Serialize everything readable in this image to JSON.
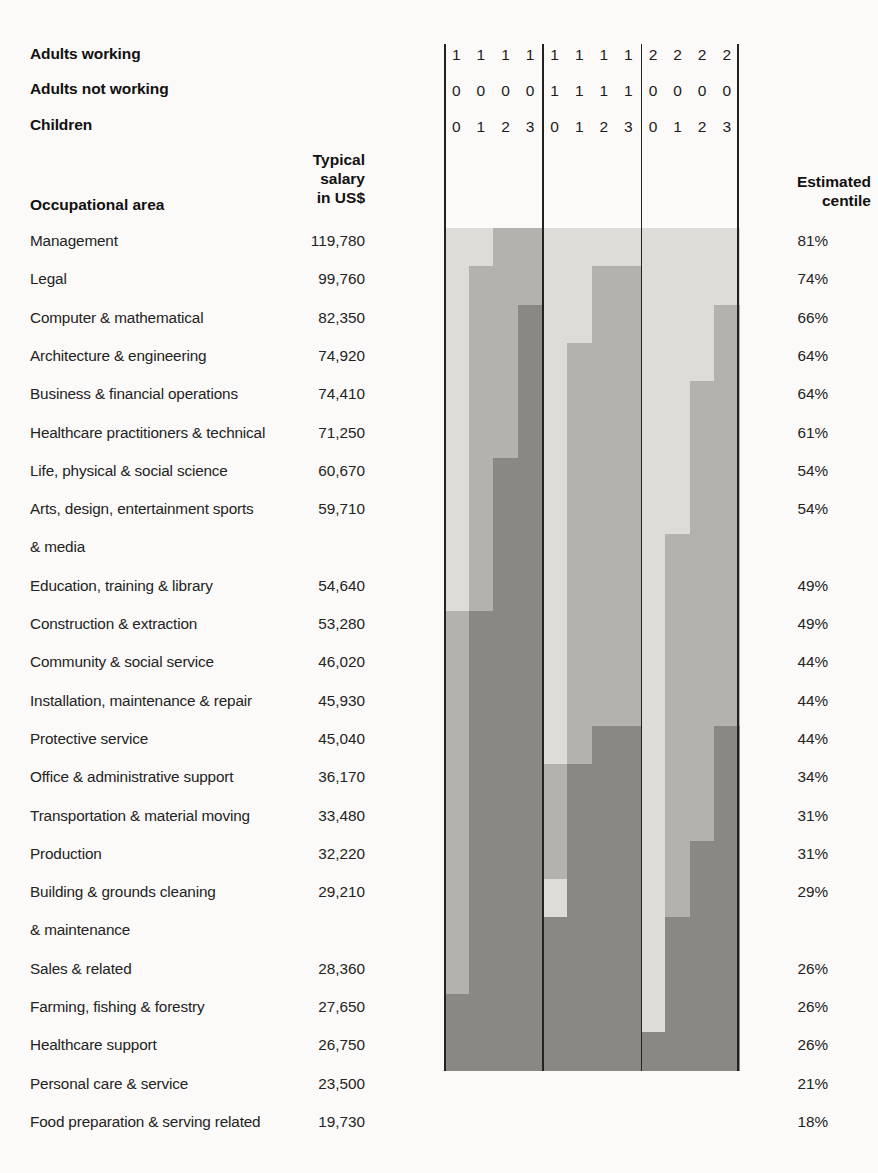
{
  "header": {
    "stack_labels": [
      {
        "name": "adults-working",
        "text": "Adults working"
      },
      {
        "name": "adults-not-working",
        "text": "Adults not working"
      },
      {
        "name": "children",
        "text": "Children"
      }
    ],
    "occupation_column_title": "Occupational area",
    "salary_column_title": "Typical\nsalary\nin US$",
    "centile_column_title": "Estimated\ncentile",
    "digit_rows": [
      [
        "1",
        "1",
        "1",
        "1",
        "1",
        "1",
        "1",
        "1",
        "2",
        "2",
        "2",
        "2"
      ],
      [
        "0",
        "0",
        "0",
        "0",
        "1",
        "1",
        "1",
        "1",
        "0",
        "0",
        "0",
        "0"
      ],
      [
        "0",
        "1",
        "2",
        "3",
        "0",
        "1",
        "2",
        "3",
        "0",
        "1",
        "2",
        "3"
      ]
    ]
  },
  "palette": {
    "light": "#dedcd9",
    "medium": "#b4b2ae",
    "dark": "#8a8884",
    "rule": "#24221f",
    "page_bg": "#fbfaf8"
  },
  "chart_data": {
    "type": "heatmap",
    "xlabel": "",
    "ylabel": "Occupational area",
    "legend": [
      "Adults working",
      "Adults not working",
      "Children"
    ],
    "grid": false,
    "column_groups": [
      {
        "adults_working": "1",
        "adults_not_working": "0",
        "children": [
          "0",
          "1",
          "2",
          "3"
        ]
      },
      {
        "adults_working": "1",
        "adults_not_working": "1",
        "children": [
          "0",
          "1",
          "2",
          "3"
        ]
      },
      {
        "adults_working": "2",
        "adults_not_working": "0",
        "children": [
          "0",
          "1",
          "2",
          "3"
        ]
      }
    ],
    "columns": [
      "1-0-0",
      "1-0-1",
      "1-0-2",
      "1-0-3",
      "1-1-0",
      "1-1-1",
      "1-1-2",
      "1-1-3",
      "2-0-0",
      "2-0-1",
      "2-0-2",
      "2-0-3"
    ],
    "shade_levels": [
      "light",
      "medium",
      "dark"
    ],
    "categories": [
      "Management",
      "Legal",
      "Computer & mathematical",
      "Architecture & engineering",
      "Business & financial operations",
      "Healthcare practitioners & technical",
      "Life, physical & social science",
      "Arts, design, entertainment sports & media",
      "Education, training & library",
      "Construction & extraction",
      "Community & social service",
      "Installation, maintenance & repair",
      "Protective service",
      "Office & administrative support",
      "Transportation & material moving",
      "Production",
      "Building & grounds cleaning & maintenance",
      "Sales & related",
      "Farming, fishing & forestry",
      "Healthcare support",
      "Personal care & service",
      "Food preparation & serving related"
    ],
    "rows": [
      {
        "occupation": "Management",
        "occupation_lines": [
          "Management"
        ],
        "salary": "119,780",
        "salary_value": 119780,
        "centile": "81%",
        "centile_value": 81,
        "cells": [
          "light",
          "light",
          "medium",
          "medium",
          "light",
          "light",
          "light",
          "light",
          "light",
          "light",
          "light",
          "light"
        ]
      },
      {
        "occupation": "Legal",
        "occupation_lines": [
          "Legal"
        ],
        "salary": "99,760",
        "salary_value": 99760,
        "centile": "74%",
        "centile_value": 74,
        "cells": [
          "light",
          "medium",
          "medium",
          "medium",
          "light",
          "light",
          "medium",
          "medium",
          "light",
          "light",
          "light",
          "light"
        ]
      },
      {
        "occupation": "Computer & mathematical",
        "occupation_lines": [
          "Computer & mathematical"
        ],
        "salary": "82,350",
        "salary_value": 82350,
        "centile": "66%",
        "centile_value": 66,
        "cells": [
          "light",
          "medium",
          "medium",
          "dark",
          "light",
          "light",
          "medium",
          "medium",
          "light",
          "light",
          "light",
          "medium"
        ]
      },
      {
        "occupation": "Architecture & engineering",
        "occupation_lines": [
          "Architecture & engineering"
        ],
        "salary": "74,920",
        "salary_value": 74920,
        "centile": "64%",
        "centile_value": 64,
        "cells": [
          "light",
          "medium",
          "medium",
          "dark",
          "light",
          "medium",
          "medium",
          "medium",
          "light",
          "light",
          "light",
          "medium"
        ]
      },
      {
        "occupation": "Business & financial operations",
        "occupation_lines": [
          "Business & financial operations"
        ],
        "salary": "74,410",
        "salary_value": 74410,
        "centile": "64%",
        "centile_value": 64,
        "cells": [
          "light",
          "medium",
          "medium",
          "dark",
          "light",
          "medium",
          "medium",
          "medium",
          "light",
          "light",
          "medium",
          "medium"
        ]
      },
      {
        "occupation": "Healthcare practitioners & technical",
        "occupation_lines": [
          "Healthcare practitioners & technical"
        ],
        "salary": "71,250",
        "salary_value": 71250,
        "centile": "61%",
        "centile_value": 61,
        "cells": [
          "light",
          "medium",
          "medium",
          "dark",
          "light",
          "medium",
          "medium",
          "medium",
          "light",
          "light",
          "medium",
          "medium"
        ]
      },
      {
        "occupation": "Life, physical & social science",
        "occupation_lines": [
          "Life, physical & social science"
        ],
        "salary": "60,670",
        "salary_value": 60670,
        "centile": "54%",
        "centile_value": 54,
        "cells": [
          "light",
          "medium",
          "dark",
          "dark",
          "light",
          "medium",
          "medium",
          "medium",
          "light",
          "light",
          "medium",
          "medium"
        ]
      },
      {
        "occupation": "Arts, design, entertainment sports & media",
        "occupation_lines": [
          "Arts, design, entertainment sports",
          "& media"
        ],
        "salary": "59,710",
        "salary_value": 59710,
        "centile": "54%",
        "centile_value": 54,
        "cells": [
          "light",
          "medium",
          "dark",
          "dark",
          "light",
          "medium",
          "medium",
          "medium",
          "light",
          "light",
          "medium",
          "medium"
        ]
      },
      {
        "occupation": "Education, training & library",
        "occupation_lines": [
          "Education, training & library"
        ],
        "salary": "54,640",
        "salary_value": 54640,
        "centile": "49%",
        "centile_value": 49,
        "cells": [
          "light",
          "medium",
          "dark",
          "dark",
          "light",
          "medium",
          "medium",
          "medium",
          "light",
          "medium",
          "medium",
          "medium"
        ]
      },
      {
        "occupation": "Construction & extraction",
        "occupation_lines": [
          "Construction & extraction"
        ],
        "salary": "53,280",
        "salary_value": 53280,
        "centile": "49%",
        "centile_value": 49,
        "cells": [
          "light",
          "medium",
          "dark",
          "dark",
          "light",
          "medium",
          "medium",
          "medium",
          "light",
          "medium",
          "medium",
          "medium"
        ]
      },
      {
        "occupation": "Community & social service",
        "occupation_lines": [
          "Community & social service"
        ],
        "salary": "46,020",
        "salary_value": 46020,
        "centile": "44%",
        "centile_value": 44,
        "cells": [
          "medium",
          "dark",
          "dark",
          "dark",
          "light",
          "medium",
          "medium",
          "medium",
          "light",
          "medium",
          "medium",
          "medium"
        ]
      },
      {
        "occupation": "Installation, maintenance & repair",
        "occupation_lines": [
          "Installation, maintenance & repair"
        ],
        "salary": "45,930",
        "salary_value": 45930,
        "centile": "44%",
        "centile_value": 44,
        "cells": [
          "medium",
          "dark",
          "dark",
          "dark",
          "light",
          "medium",
          "medium",
          "medium",
          "light",
          "medium",
          "medium",
          "medium"
        ]
      },
      {
        "occupation": "Protective service",
        "occupation_lines": [
          "Protective service"
        ],
        "salary": "45,040",
        "salary_value": 45040,
        "centile": "44%",
        "centile_value": 44,
        "cells": [
          "medium",
          "dark",
          "dark",
          "dark",
          "light",
          "medium",
          "medium",
          "medium",
          "light",
          "medium",
          "medium",
          "medium"
        ]
      },
      {
        "occupation": "Office & administrative support",
        "occupation_lines": [
          "Office & administrative support"
        ],
        "salary": "36,170",
        "salary_value": 36170,
        "centile": "34%",
        "centile_value": 34,
        "cells": [
          "medium",
          "dark",
          "dark",
          "dark",
          "light",
          "medium",
          "dark",
          "dark",
          "light",
          "medium",
          "medium",
          "dark"
        ]
      },
      {
        "occupation": "Transportation & material moving",
        "occupation_lines": [
          "Transportation & material moving"
        ],
        "salary": "33,480",
        "salary_value": 33480,
        "centile": "31%",
        "centile_value": 31,
        "cells": [
          "medium",
          "dark",
          "dark",
          "dark",
          "medium",
          "dark",
          "dark",
          "dark",
          "light",
          "medium",
          "medium",
          "dark"
        ]
      },
      {
        "occupation": "Production",
        "occupation_lines": [
          "Production"
        ],
        "salary": "32,220",
        "salary_value": 32220,
        "centile": "31%",
        "centile_value": 31,
        "cells": [
          "medium",
          "dark",
          "dark",
          "dark",
          "medium",
          "dark",
          "dark",
          "dark",
          "light",
          "medium",
          "medium",
          "dark"
        ]
      },
      {
        "occupation": "Building & grounds cleaning & maintenance",
        "occupation_lines": [
          "Building & grounds cleaning",
          "& maintenance"
        ],
        "salary": "29,210",
        "salary_value": 29210,
        "centile": "29%",
        "centile_value": 29,
        "cells": [
          "medium",
          "dark",
          "dark",
          "dark",
          "medium",
          "dark",
          "dark",
          "dark",
          "light",
          "medium",
          "dark",
          "dark"
        ]
      },
      {
        "occupation": "Sales & related",
        "occupation_lines": [
          "Sales & related"
        ],
        "salary": "28,360",
        "salary_value": 28360,
        "centile": "26%",
        "centile_value": 26,
        "cells": [
          "medium",
          "dark",
          "dark",
          "dark",
          "light",
          "dark",
          "dark",
          "dark",
          "light",
          "medium",
          "dark",
          "dark"
        ]
      },
      {
        "occupation": "Farming, fishing & forestry",
        "occupation_lines": [
          "Farming, fishing & forestry"
        ],
        "salary": "27,650",
        "salary_value": 27650,
        "centile": "26%",
        "centile_value": 26,
        "cells": [
          "medium",
          "dark",
          "dark",
          "dark",
          "dark",
          "dark",
          "dark",
          "dark",
          "light",
          "dark",
          "dark",
          "dark"
        ]
      },
      {
        "occupation": "Healthcare support",
        "occupation_lines": [
          "Healthcare support"
        ],
        "salary": "26,750",
        "salary_value": 26750,
        "centile": "26%",
        "centile_value": 26,
        "cells": [
          "medium",
          "dark",
          "dark",
          "dark",
          "dark",
          "dark",
          "dark",
          "dark",
          "light",
          "dark",
          "dark",
          "dark"
        ]
      },
      {
        "occupation": "Personal care & service",
        "occupation_lines": [
          "Personal care & service"
        ],
        "salary": "23,500",
        "salary_value": 23500,
        "centile": "21%",
        "centile_value": 21,
        "cells": [
          "dark",
          "dark",
          "dark",
          "dark",
          "dark",
          "dark",
          "dark",
          "dark",
          "light",
          "dark",
          "dark",
          "dark"
        ]
      },
      {
        "occupation": "Food preparation & serving related",
        "occupation_lines": [
          "Food preparation & serving related"
        ],
        "salary": "19,730",
        "salary_value": 19730,
        "centile": "18%",
        "centile_value": 18,
        "cells": [
          "dark",
          "dark",
          "dark",
          "dark",
          "dark",
          "dark",
          "dark",
          "dark",
          "dark",
          "dark",
          "dark",
          "dark"
        ]
      }
    ]
  }
}
